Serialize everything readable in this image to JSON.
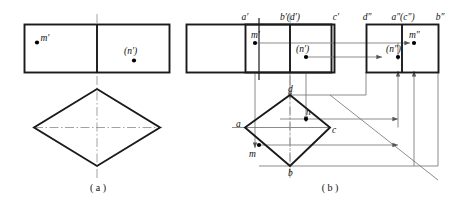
{
  "figure": {
    "captions": {
      "a": "( a )",
      "b": "( b )"
    },
    "panel_a": {
      "name": "incomplete-three-view-drawing",
      "front_view": {
        "point_m_label": "m′",
        "point_n_label": "(n′)"
      },
      "side_view": {
        "labels": []
      },
      "top_view": {
        "labels": []
      }
    },
    "panel_b": {
      "name": "completed-three-view-drawing-with-projection-lines",
      "front_view": {
        "vertex_labels": [
          "a′",
          "b′(d′)",
          "c′"
        ],
        "point_m_label": "m′",
        "point_n_label": "(n′)"
      },
      "side_view": {
        "vertex_labels": [
          "d″",
          "a″(c″)",
          "b″"
        ],
        "point_m_label": "m″",
        "point_n_label": "(n″)"
      },
      "top_view": {
        "vertex_labels": [
          "a",
          "b",
          "c",
          "d"
        ],
        "point_m_label": "m",
        "point_n_label": "n"
      }
    },
    "colors": {
      "outline": "#1a1a1a",
      "projection": "#777777",
      "centerline": "#8a8a8a",
      "point": "#000000",
      "background": "#ffffff"
    }
  }
}
